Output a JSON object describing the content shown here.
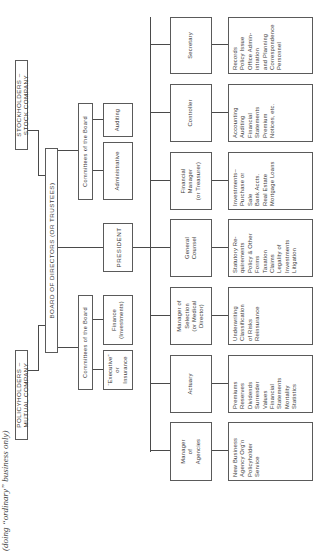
{
  "subtitle": "(doing “ordinary” business only)",
  "owners": {
    "stock": "STOCKHOLDERS – STOCK COMPANY",
    "mutual": "POLICYHOLDERS – MUTUAL COMPANY"
  },
  "board": "BOARD OF DIRECTORS (OR TRUSTEES)",
  "president": "PRESIDENT",
  "committees": {
    "upper": {
      "label": "Committees of the Board",
      "items": [
        "Auditing",
        "Administrative"
      ]
    },
    "lower": {
      "label": "Committees of the Board",
      "items": [
        "Finance\n(Investments)",
        "“Executive”\nor\nInsurance"
      ]
    }
  },
  "officers": [
    {
      "title": "Secretary",
      "duties": "Records\nPolicy Issue\nOffice Admin-\n    istration\n    and Planning\nCorrespondence\nPersonnel"
    },
    {
      "title": "Controller",
      "duties": "Accounting\nAuditing\nFinancial\n    Statements\nPremium\n    Notices, etc."
    },
    {
      "title": "Financial\nManager\n(or Treasurer)",
      "duties": "Investments–\nPurchase or\n    Sale\nBank Accts.\nReal Estate\nMortgage Loans"
    },
    {
      "title": "General\nCounsel",
      "duties": "Statutory Re-\n    quirements\nPolicy & Other\n    Forms\nTaxation\nClaims\nLegality of\n    Investments\nLitigation"
    },
    {
      "title": "Manager of\nSelection\n(or Medical\nDirector)",
      "duties": "Underwriting\nClassification\n    of Risks\nReinsurance"
    },
    {
      "title": "Actuary",
      "duties": "Premiums\nReserves\nDividends\nSurrender\n    Values\nFinancial\n    Statements\nMortality\n    Statistics"
    },
    {
      "title": "Manager\nof\nAgencies",
      "duties": "New Business\nAgency Org'n\nPolicyholder\n    Service"
    }
  ]
}
